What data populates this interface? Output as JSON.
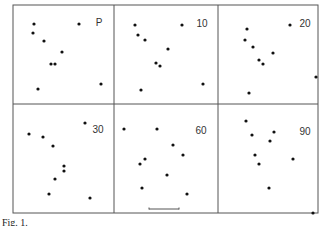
{
  "figure": {
    "frame": {
      "x0": 13,
      "y0": 5,
      "x1": 318,
      "y1": 213,
      "col_dividers": [
        114,
        218
      ],
      "row_divider": 104
    },
    "dot_color": "#111111",
    "line_color": "#555555",
    "label_color": "#333333",
    "caption": "Fig. 1."
  },
  "chart_data": {
    "type": "scatter",
    "title": "",
    "layout": "2x3 grid of panels, each showing 9 points (pixel coordinates in figure)",
    "panels": [
      {
        "label": "P",
        "label_pos": [
          99,
          22
        ],
        "points": [
          [
            34,
            24
          ],
          [
            33,
            33
          ],
          [
            44,
            41
          ],
          [
            62,
            52
          ],
          [
            51,
            64
          ],
          [
            55,
            64
          ],
          [
            38,
            89
          ],
          [
            79,
            24
          ],
          [
            101,
            84
          ]
        ]
      },
      {
        "label": "10",
        "label_pos": [
          202,
          23
        ],
        "points": [
          [
            135,
            25
          ],
          [
            138,
            35
          ],
          [
            145,
            40
          ],
          [
            168,
            49
          ],
          [
            156,
            63
          ],
          [
            160,
            66
          ],
          [
            141,
            90
          ],
          [
            182,
            25
          ],
          [
            203,
            84
          ]
        ]
      },
      {
        "label": "20",
        "label_pos": [
          305,
          23
        ],
        "points": [
          [
            247,
            29
          ],
          [
            245,
            40
          ],
          [
            253,
            47
          ],
          [
            273,
            53
          ],
          [
            259,
            60
          ],
          [
            263,
            64
          ],
          [
            249,
            93
          ],
          [
            290,
            25
          ],
          [
            316,
            77
          ]
        ]
      },
      {
        "label": "30",
        "label_pos": [
          98,
          129
        ],
        "points": [
          [
            29,
            134
          ],
          [
            43,
            137
          ],
          [
            53,
            146
          ],
          [
            64,
            166
          ],
          [
            64,
            171
          ],
          [
            55,
            179
          ],
          [
            49,
            194
          ],
          [
            85,
            123
          ],
          [
            90,
            198
          ]
        ]
      },
      {
        "label": "60",
        "label_pos": [
          201,
          130
        ],
        "points": [
          [
            124,
            129
          ],
          [
            157,
            129
          ],
          [
            173,
            145
          ],
          [
            183,
            155
          ],
          [
            145,
            159
          ],
          [
            140,
            164
          ],
          [
            167,
            175
          ],
          [
            142,
            188
          ],
          [
            187,
            194
          ]
        ]
      },
      {
        "label": "90",
        "label_pos": [
          305,
          131
        ],
        "points": [
          [
            246,
            121
          ],
          [
            252,
            135
          ],
          [
            274,
            132
          ],
          [
            270,
            141
          ],
          [
            255,
            155
          ],
          [
            259,
            164
          ],
          [
            293,
            159
          ],
          [
            269,
            188
          ],
          [
            313,
            213
          ]
        ]
      }
    ],
    "scale_bar": {
      "x0": 149,
      "x1": 179,
      "y": 209
    },
    "grid": false,
    "legend": "none"
  }
}
